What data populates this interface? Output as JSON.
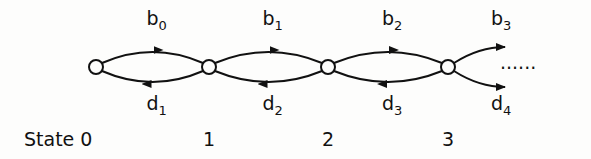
{
  "diagram": {
    "type": "birth-death-chain",
    "states": [
      {
        "id": 0,
        "label": "State 0"
      },
      {
        "id": 1,
        "label": "1"
      },
      {
        "id": 2,
        "label": "2"
      },
      {
        "id": 3,
        "label": "3"
      }
    ],
    "forward_arcs": [
      {
        "from": 0,
        "to": 1,
        "base": "b",
        "sub": "0"
      },
      {
        "from": 1,
        "to": 2,
        "base": "b",
        "sub": "1"
      },
      {
        "from": 2,
        "to": 3,
        "base": "b",
        "sub": "2"
      },
      {
        "from": 3,
        "to": null,
        "base": "b",
        "sub": "3"
      }
    ],
    "backward_arcs": [
      {
        "from": 1,
        "to": 0,
        "base": "d",
        "sub": "1"
      },
      {
        "from": 2,
        "to": 1,
        "base": "d",
        "sub": "2"
      },
      {
        "from": 3,
        "to": 2,
        "base": "d",
        "sub": "3"
      },
      {
        "from": null,
        "to": 3,
        "base": "d",
        "sub": "4"
      }
    ],
    "continuation": "......",
    "colors": {
      "ink": "#111111",
      "background": "#fdfdfc"
    }
  }
}
